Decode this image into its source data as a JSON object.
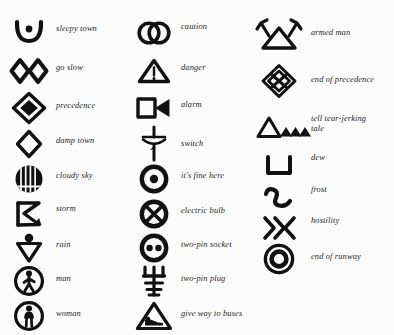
{
  "page": {
    "background_color": "#fcfcfc",
    "ink_color": "#111111",
    "columns": 3
  },
  "columns": [
    {
      "name": "left-column",
      "entries": [
        {
          "icon": "bowl-with-dot-icon",
          "label": "sleepy town",
          "y": 14
        },
        {
          "icon": "double-diamond-icon",
          "label": "go slow",
          "y": 52
        },
        {
          "icon": "diamond-in-diamond-icon",
          "label": "precedence",
          "y": 89
        },
        {
          "icon": "outline-diamond-icon",
          "label": "damp town",
          "y": 125
        },
        {
          "icon": "striped-circle-icon",
          "label": "cloudy sky",
          "y": 160
        },
        {
          "icon": "zigzag-bolt-icon",
          "label": "storm",
          "y": 195
        },
        {
          "icon": "dot-over-triangle-icon",
          "label": "rain",
          "y": 229
        },
        {
          "icon": "circled-walking-man-icon",
          "label": "man",
          "y": 262
        },
        {
          "icon": "circled-woman-icon",
          "label": "woman",
          "y": 297
        }
      ]
    },
    {
      "name": "middle-column",
      "entries": [
        {
          "icon": "interlocked-circles-icon",
          "label": "caution",
          "y": 14
        },
        {
          "icon": "triangle-exclamation-icon",
          "label": "danger",
          "y": 52
        },
        {
          "icon": "square-bowtie-icon",
          "label": "alarm",
          "y": 89
        },
        {
          "icon": "switch-lever-icon",
          "label": "switch",
          "y": 125
        },
        {
          "icon": "circled-dot-icon",
          "label": "it's fine here",
          "y": 160
        },
        {
          "icon": "circled-cross-icon",
          "label": "electric bulb",
          "y": 195
        },
        {
          "icon": "circled-two-dots-icon",
          "label": "two-pin socket",
          "y": 229
        },
        {
          "icon": "trident-plug-icon",
          "label": "two-pin plug",
          "y": 262
        },
        {
          "icon": "triangle-bus-icon",
          "label": "give way to buses",
          "y": 297
        }
      ]
    },
    {
      "name": "right-column",
      "entries": [
        {
          "icon": "antlered-triangle-icon",
          "label": "armed man",
          "y": 14
        },
        {
          "icon": "knotted-diamond-icon",
          "label": "end of precedence",
          "y": 62
        },
        {
          "icon": "triangle-and-peaks-icon",
          "label": "tell tear-jerking\ntale",
          "y": 108
        },
        {
          "icon": "bracket-u-icon",
          "label": "dew",
          "y": 147
        },
        {
          "icon": "wave-two-icon",
          "label": "frost",
          "y": 179
        },
        {
          "icon": "double-chevron-icon",
          "label": "hostility",
          "y": 209
        },
        {
          "icon": "concentric-ring-icon",
          "label": "end of runway",
          "y": 240
        }
      ]
    }
  ]
}
